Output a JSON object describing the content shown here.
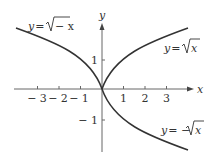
{
  "figure": {
    "type": "function-graph",
    "axes": {
      "x_label": "x",
      "y_label": "y",
      "x_ticks": [
        "− 3",
        "− 2",
        "− 1",
        "1",
        "2",
        "3"
      ],
      "y_ticks": [
        "1",
        "− 1"
      ]
    },
    "curves": [
      {
        "name": "sqrt-neg-x",
        "label_y": "y",
        "label_eq": "=",
        "label_expr": "− x",
        "formula": "y = sqrt(-x)",
        "domain": [
          -4,
          0
        ]
      },
      {
        "name": "sqrt-x",
        "label_y": "y",
        "label_eq": "=",
        "label_expr": "x",
        "formula": "y = sqrt(x)",
        "domain": [
          0,
          4
        ]
      },
      {
        "name": "neg-sqrt-x",
        "label_y": "y",
        "label_eq": "= −",
        "label_expr": "x",
        "formula": "y = -sqrt(x)",
        "domain": [
          0,
          4
        ]
      }
    ],
    "colors": {
      "axis": "#555555",
      "curve": "#333333",
      "text": "#333333"
    }
  }
}
